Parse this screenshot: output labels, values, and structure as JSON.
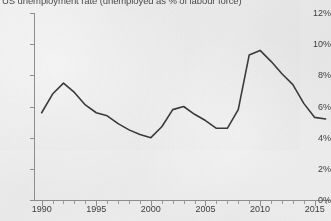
{
  "chart_title": "US unemployment rate (unemployed as % of labour force)",
  "axes": {
    "y_tick_labels": [
      "12%",
      "10%",
      "8%",
      "6%",
      "4%",
      "2%",
      "0%"
    ],
    "x_tick_labels": [
      "1990",
      "1995",
      "2000",
      "2005",
      "2010",
      "2015"
    ]
  },
  "colors": {
    "line": "#3a3a3a",
    "axis": "#8d8d8d",
    "text": "#3d3d3d",
    "background": "#ececec"
  },
  "chart_data": {
    "type": "line",
    "title": "US unemployment rate (unemployed as % of labour force)",
    "xlabel": "",
    "ylabel": "",
    "xlim": [
      1989.3,
      2016.4
    ],
    "ylim": [
      0,
      12
    ],
    "yticks": [
      0,
      2,
      4,
      6,
      8,
      10,
      12
    ],
    "ytick_labels": [
      "0%",
      "2%",
      "4%",
      "6%",
      "8%",
      "10%",
      "12%"
    ],
    "xticks": [
      1990,
      1995,
      2000,
      2005,
      2010,
      2015
    ],
    "xtick_labels": [
      "1990",
      "1995",
      "2000",
      "2005",
      "2010",
      "2015"
    ],
    "x_minor_tick_step": 1,
    "grid": false,
    "legend": false,
    "series": [
      {
        "name": "US unemployment rate",
        "unit": "%",
        "x": [
          1990,
          1991,
          1992,
          1993,
          1994,
          1995,
          1996,
          1997,
          1998,
          1999,
          2000,
          2001,
          2002,
          2003,
          2004,
          2005,
          2006,
          2007,
          2008,
          2009,
          2010,
          2011,
          2012,
          2013,
          2014,
          2015,
          2016
        ],
        "values": [
          5.6,
          6.8,
          7.5,
          6.9,
          6.1,
          5.6,
          5.4,
          4.9,
          4.5,
          4.2,
          4.0,
          4.7,
          5.8,
          6.0,
          5.5,
          5.1,
          4.6,
          4.6,
          5.8,
          9.3,
          9.6,
          8.9,
          8.1,
          7.4,
          6.2,
          5.3,
          5.2
        ]
      }
    ],
    "annotations": []
  }
}
